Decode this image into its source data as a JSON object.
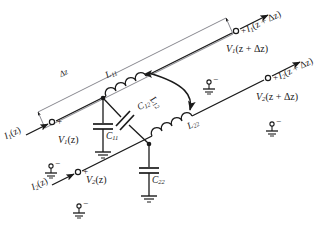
{
  "figure": {
    "background_color": "#ffffff",
    "line_color": "#1a1a1a",
    "text_color": "#1a1a1a"
  },
  "labels": {
    "i1_z": "I",
    "i1_z_sub": "1",
    "i1_z_arg": "(z)",
    "i1_zdz": "I",
    "i1_zdz_sub": "1",
    "i1_zdz_arg": "(z + Δz)",
    "i2_z": "I",
    "i2_z_sub": "2",
    "i2_z_arg": "(z)",
    "i2_zdz": "I",
    "i2_zdz_sub": "2",
    "i2_zdz_arg": "(z + Δz)",
    "v1_z": "V",
    "v1_z_sub": "1",
    "v1_z_arg": "(z)",
    "v1_zdz": "V",
    "v1_zdz_sub": "1",
    "v1_zdz_arg": "(z + Δz)",
    "v2_z": "V",
    "v2_z_sub": "2",
    "v2_z_arg": "(z)",
    "v2_zdz": "V",
    "v2_zdz_sub": "2",
    "v2_zdz_arg": "(z + Δz)",
    "delta_z": "Δz",
    "l11": "L",
    "l11_sub": "11",
    "l12": "L",
    "l12_sub": "12",
    "l22": "L",
    "l22_sub": "22",
    "c11": "C",
    "c11_sub": "11",
    "c12": "C",
    "c12_sub": "12",
    "c22": "C",
    "c22_sub": "22",
    "plus": "+",
    "minus": "−"
  },
  "terminals": {
    "port1_in_polarity": "+",
    "port1_out_polarity": "+",
    "port2_in_polarity": "+",
    "port2_out_polarity": "+",
    "ground_polarity": "−",
    "ground_count": 4
  },
  "components": {
    "inductors": [
      "L11",
      "L12",
      "L22"
    ],
    "capacitors": [
      "C11",
      "C12",
      "C22"
    ],
    "coupling": "L12 mutual inductance arc between L11 and L22"
  }
}
